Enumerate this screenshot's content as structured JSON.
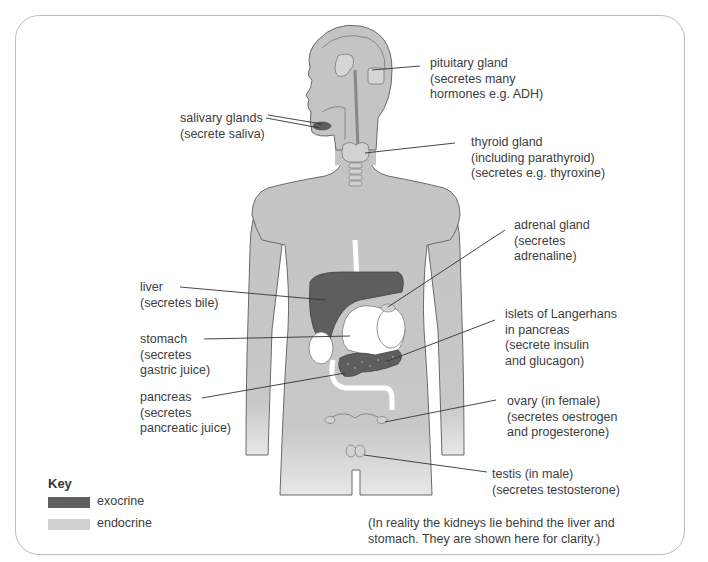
{
  "diagram": {
    "labels": {
      "pituitary": "pituitary gland\n(secretes many\nhormones e.g. ADH)",
      "salivary": "salivary glands\n(secrete saliva)",
      "thyroid": "thyroid gland\n(including parathyroid)\n(secretes e.g. thyroxine)",
      "adrenal": "adrenal gland\n(secretes\nadrenaline)",
      "liver": "liver\n(secretes bile)",
      "stomach": "stomach\n(secretes\ngastric juice)",
      "islets": "islets of Langerhans\nin pancreas\n(secrete insulin\nand glucagon)",
      "pancreas": "pancreas\n(secretes\npancreatic juice)",
      "ovary": "ovary (in female)\n(secretes oestrogen\nand progesterone)",
      "testis": "testis (in male)\n(secretes testosterone)"
    },
    "key": {
      "title": "Key",
      "items": [
        {
          "label": "exocrine",
          "color": "#606060"
        },
        {
          "label": "endocrine",
          "color": "#cfcfcf"
        }
      ]
    },
    "note": "(In reality the kidneys lie behind the liver and\nstomach. They are shown here for clarity.)",
    "colors": {
      "body": "#c4c4c4",
      "outline": "#6a6a6a",
      "exocrine": "#5e5e5e",
      "frame": "#bdbdbd"
    }
  }
}
